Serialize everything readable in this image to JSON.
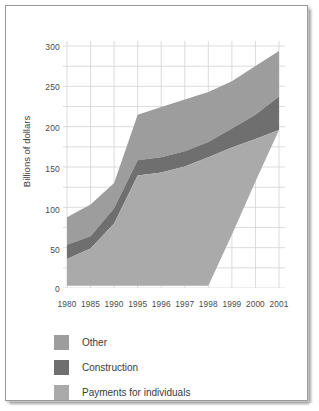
{
  "figure": {
    "border_color": "#9a9a9a",
    "background": "#ffffff"
  },
  "axis": {
    "ylabel": "Billions of dollars",
    "yticks": [
      "0",
      "50",
      "100",
      "150",
      "200",
      "250",
      "300"
    ],
    "xticks": [
      "1980",
      "1985",
      "1990",
      "1995",
      "1996",
      "1997",
      "1998",
      "1999",
      "2000",
      "2001"
    ]
  },
  "legend": {
    "items": [
      {
        "label": "Other",
        "color": "#9d9d9d"
      },
      {
        "label": "Construction",
        "color": "#6f6f6f"
      },
      {
        "label": "Payments for individuals",
        "color": "#aaaaaa"
      }
    ]
  },
  "chart_data": {
    "type": "area",
    "title": "",
    "xlabel": "",
    "ylabel": "Billions of dollars",
    "ylim": [
      0,
      325
    ],
    "yticks": [
      0,
      50,
      100,
      150,
      200,
      250,
      300
    ],
    "grid": true,
    "legend_position": "bottom-left",
    "stacked": true,
    "categories": [
      "1980",
      "1985",
      "1990",
      "1995",
      "1996",
      "1997",
      "1998",
      "1999",
      "2000",
      "2001"
    ],
    "series": [
      {
        "name": "Payments for individuals",
        "color": "#aaaaaa",
        "values": [
          38,
          52,
          85,
          148,
          152,
          160,
          172,
          185,
          196,
          208
        ]
      },
      {
        "name": "Construction",
        "color": "#6f6f6f",
        "values": [
          19,
          16,
          20,
          20,
          20,
          20,
          20,
          25,
          32,
          44
        ]
      },
      {
        "name": "Other",
        "color": "#9d9d9d",
        "values": [
          36,
          42,
          33,
          60,
          66,
          68,
          66,
          62,
          64,
          60
        ]
      }
    ],
    "cumulative": {
      "payments_top": [
        38,
        52,
        85,
        148,
        152,
        160,
        172,
        185,
        196,
        208
      ],
      "construction_top": [
        57,
        68,
        105,
        168,
        172,
        180,
        192,
        210,
        228,
        252
      ],
      "total_top": [
        93,
        110,
        138,
        228,
        238,
        248,
        258,
        272,
        292,
        312
      ]
    },
    "baseline_note": "Stack baseline is 0 through 1998, then rises diagonally to the 2001 right edge where the light band is truncated.",
    "baseline": [
      3,
      3,
      3,
      3,
      3,
      3,
      3,
      70,
      140,
      208
    ]
  }
}
